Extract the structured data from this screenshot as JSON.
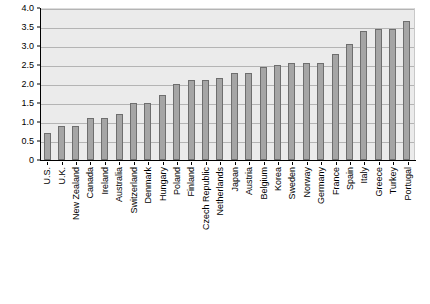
{
  "chart_data": {
    "type": "bar",
    "title": "",
    "subtitle": "",
    "xlabel": "",
    "ylabel": "",
    "ylim": [
      0,
      4.0
    ],
    "grid": true,
    "legend": false,
    "y_ticks": [
      "4.0",
      "3.5",
      "3.0",
      "2.5",
      "2.0",
      "1.5",
      "1.0",
      "0.5",
      "0"
    ],
    "y_tick_values": [
      4.0,
      3.5,
      3.0,
      2.5,
      2.0,
      1.5,
      1.0,
      0.5,
      0
    ],
    "categories": [
      "U.S.",
      "U.K.",
      "New Zealand",
      "Canada",
      "Ireland",
      "Australia",
      "Switzerland",
      "Denmark",
      "Hungary",
      "Poland",
      "Finland",
      "Czech Republic",
      "Netherlands",
      "Japan",
      "Austria",
      "Belgium",
      "Korea",
      "Sweden",
      "Norway",
      "Germany",
      "France",
      "Spain",
      "Italy",
      "Greece",
      "Turkey",
      "Portugal"
    ],
    "values": [
      0.7,
      0.9,
      0.9,
      1.1,
      1.1,
      1.2,
      1.5,
      1.5,
      1.7,
      2.0,
      2.1,
      2.1,
      2.15,
      2.3,
      2.3,
      2.45,
      2.5,
      2.55,
      2.55,
      2.55,
      2.8,
      3.05,
      3.4,
      3.45,
      3.45,
      3.65
    ],
    "colors": {
      "bar_fill": "#a5a5a5",
      "bar_border": "#6e6e6e",
      "plot_background": "#ebebeb",
      "gridline": "#b4b4b4",
      "axis": "#000000",
      "text": "#000000",
      "figure_background": "#ffffff"
    }
  }
}
